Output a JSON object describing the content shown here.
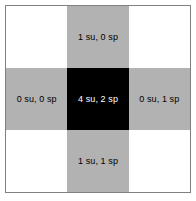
{
  "diagram": {
    "type": "grid-3x3-plus-pattern",
    "colors": {
      "white_cell": "#ffffff",
      "gray_cell": "#b2b2b2",
      "black_cell": "#000000",
      "border": "#808080",
      "dark_text": "#000000",
      "light_text": "#ffffff"
    },
    "grid": {
      "rows": 3,
      "columns": 3,
      "cells": [
        {
          "row": 0,
          "col": 0,
          "fill": "white",
          "label": "",
          "text_color": "dark"
        },
        {
          "row": 0,
          "col": 1,
          "fill": "gray",
          "label": "1 su, 0 sp",
          "text_color": "dark"
        },
        {
          "row": 0,
          "col": 2,
          "fill": "white",
          "label": "",
          "text_color": "dark"
        },
        {
          "row": 1,
          "col": 0,
          "fill": "gray",
          "label": "0 su, 0 sp",
          "text_color": "dark"
        },
        {
          "row": 1,
          "col": 1,
          "fill": "black",
          "label": "4 su, 2 sp",
          "text_color": "light"
        },
        {
          "row": 1,
          "col": 2,
          "fill": "gray",
          "label": "0 su, 1 sp",
          "text_color": "dark"
        },
        {
          "row": 2,
          "col": 0,
          "fill": "white",
          "label": "",
          "text_color": "dark"
        },
        {
          "row": 2,
          "col": 1,
          "fill": "gray",
          "label": "1 su, 1 sp",
          "text_color": "dark"
        },
        {
          "row": 2,
          "col": 2,
          "fill": "white",
          "label": "",
          "text_color": "dark"
        }
      ]
    }
  }
}
